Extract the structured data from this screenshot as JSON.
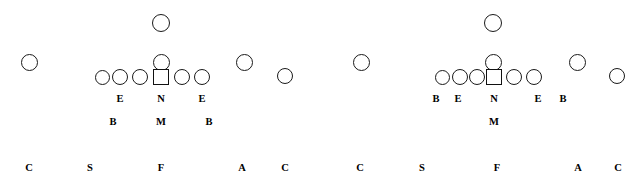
{
  "diagram": {
    "type": "football-formation",
    "width": 641,
    "height": 188,
    "background_color": "#ffffff",
    "marker_color": "#1a1a1a",
    "label_color": "#000000"
  },
  "formations": [
    {
      "name": "left-formation",
      "markers": [
        {
          "name": "defender-wide-left",
          "shape": "circle",
          "cx": 29,
          "cy": 62,
          "d": 17
        },
        {
          "name": "defender-deep-middle",
          "shape": "circle",
          "cx": 161,
          "cy": 23,
          "d": 18
        },
        {
          "name": "defender-mid-middle",
          "shape": "circle",
          "cx": 161,
          "cy": 62,
          "d": 17
        },
        {
          "name": "defender-line-1",
          "shape": "circle",
          "cx": 102,
          "cy": 77,
          "d": 15
        },
        {
          "name": "defender-line-2",
          "shape": "circle",
          "cx": 120,
          "cy": 77,
          "d": 16
        },
        {
          "name": "defender-line-3",
          "shape": "circle",
          "cx": 140,
          "cy": 77,
          "d": 16
        },
        {
          "name": "defender-nose-square",
          "shape": "square",
          "cx": 161,
          "cy": 77,
          "d": 16
        },
        {
          "name": "defender-line-5",
          "shape": "circle",
          "cx": 182,
          "cy": 77,
          "d": 16
        },
        {
          "name": "defender-line-6",
          "shape": "circle",
          "cx": 202,
          "cy": 77,
          "d": 16
        },
        {
          "name": "defender-wide-right-in",
          "shape": "circle",
          "cx": 244,
          "cy": 62,
          "d": 17
        },
        {
          "name": "defender-wide-right-out",
          "shape": "circle",
          "cx": 285,
          "cy": 76,
          "d": 16
        }
      ],
      "line_labels": [
        {
          "name": "label-end-left",
          "text": "E",
          "x": 120,
          "y": 94
        },
        {
          "name": "label-nose",
          "text": "N",
          "x": 161,
          "y": 94
        },
        {
          "name": "label-end-right",
          "text": "E",
          "x": 202,
          "y": 94
        }
      ],
      "backer_labels": [
        {
          "name": "label-backer-left",
          "text": "B",
          "x": 113,
          "y": 117
        },
        {
          "name": "label-mike",
          "text": "M",
          "x": 161,
          "y": 117
        },
        {
          "name": "label-backer-right",
          "text": "B",
          "x": 209,
          "y": 117
        }
      ],
      "bottom_labels": [
        {
          "name": "label-corner-left",
          "text": "C",
          "x": 29,
          "y": 163
        },
        {
          "name": "label-strong-safety",
          "text": "S",
          "x": 90,
          "y": 163
        },
        {
          "name": "label-free-safety",
          "text": "F",
          "x": 161,
          "y": 163
        },
        {
          "name": "label-adjuster",
          "text": "A",
          "x": 242,
          "y": 163
        },
        {
          "name": "label-corner-right",
          "text": "C",
          "x": 285,
          "y": 163
        }
      ]
    },
    {
      "name": "right-formation",
      "markers": [
        {
          "name": "defender-wide-left",
          "shape": "circle",
          "cx": 361,
          "cy": 62,
          "d": 17
        },
        {
          "name": "defender-deep-middle",
          "shape": "circle",
          "cx": 493,
          "cy": 23,
          "d": 18
        },
        {
          "name": "defender-mid-middle",
          "shape": "circle",
          "cx": 493,
          "cy": 62,
          "d": 17
        },
        {
          "name": "defender-line-1",
          "shape": "circle",
          "cx": 442,
          "cy": 77,
          "d": 15
        },
        {
          "name": "defender-line-2",
          "shape": "circle",
          "cx": 460,
          "cy": 77,
          "d": 16
        },
        {
          "name": "defender-line-3",
          "shape": "circle",
          "cx": 477,
          "cy": 77,
          "d": 16
        },
        {
          "name": "defender-nose-square",
          "shape": "square",
          "cx": 494,
          "cy": 77,
          "d": 16
        },
        {
          "name": "defender-line-5",
          "shape": "circle",
          "cx": 514,
          "cy": 77,
          "d": 16
        },
        {
          "name": "defender-line-6",
          "shape": "circle",
          "cx": 534,
          "cy": 77,
          "d": 16
        },
        {
          "name": "defender-wide-right-in",
          "shape": "circle",
          "cx": 577,
          "cy": 62,
          "d": 17
        },
        {
          "name": "defender-wide-right-out",
          "shape": "circle",
          "cx": 617,
          "cy": 76,
          "d": 16
        }
      ],
      "line_labels": [
        {
          "name": "label-backer-left",
          "text": "B",
          "x": 436,
          "y": 94
        },
        {
          "name": "label-end-left",
          "text": "E",
          "x": 458,
          "y": 94
        },
        {
          "name": "label-nose",
          "text": "N",
          "x": 494,
          "y": 94
        },
        {
          "name": "label-end-right",
          "text": "E",
          "x": 538,
          "y": 94
        },
        {
          "name": "label-backer-right",
          "text": "B",
          "x": 563,
          "y": 94
        }
      ],
      "backer_labels": [
        {
          "name": "label-mike",
          "text": "M",
          "x": 494,
          "y": 117
        }
      ],
      "bottom_labels": [
        {
          "name": "label-corner-left",
          "text": "C",
          "x": 360,
          "y": 163
        },
        {
          "name": "label-strong-safety",
          "text": "S",
          "x": 422,
          "y": 163
        },
        {
          "name": "label-free-safety",
          "text": "F",
          "x": 497,
          "y": 163
        },
        {
          "name": "label-adjuster",
          "text": "A",
          "x": 578,
          "y": 163
        },
        {
          "name": "label-corner-right",
          "text": "C",
          "x": 618,
          "y": 163
        }
      ]
    }
  ]
}
